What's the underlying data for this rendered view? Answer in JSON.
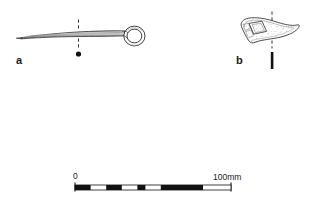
{
  "plate": {
    "background_color": "#ffffff",
    "ink_color": "#1a1a1a",
    "stipple_color": "#8a8a8a",
    "width": 323,
    "height": 201
  },
  "figures": [
    {
      "label": "a",
      "name": "ring-headed-pin",
      "description": "Long tapered shaft with circular ring head at right",
      "section_marker": "dashed vertical line with solid dot below"
    },
    {
      "label": "b",
      "name": "curved-fragment",
      "description": "Small curved stippled fragment with faceted panel",
      "section_marker": "dashed vertical line with solid bar below"
    }
  ],
  "scale_bar": {
    "name": "scale-bar",
    "start_label": "0",
    "end_label": "100mm",
    "units": "mm",
    "total_length_mm": 100,
    "segments": [
      {
        "fill": "black",
        "mm": 10
      },
      {
        "fill": "white",
        "mm": 10
      },
      {
        "fill": "black",
        "mm": 10
      },
      {
        "fill": "white",
        "mm": 10
      },
      {
        "fill": "black",
        "mm": 10
      },
      {
        "fill": "white",
        "mm": 50
      }
    ],
    "long_black_band": {
      "start_mm": 55,
      "end_mm": 82
    }
  }
}
